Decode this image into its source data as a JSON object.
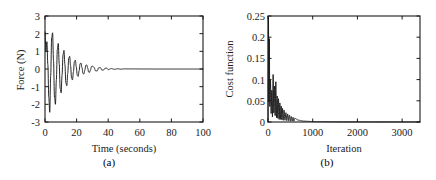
{
  "figure": {
    "background": "#ffffff",
    "line_color": "#1a1a1a",
    "panels": [
      {
        "id": "a",
        "caption": "(a)",
        "xlabel": "Time (seconds)",
        "ylabel": "Force (N)"
      },
      {
        "id": "b",
        "caption": "(b)",
        "xlabel": "Iteration",
        "ylabel": "Cost function"
      }
    ]
  },
  "chart_data": [
    {
      "type": "line",
      "panel": "a",
      "title": "",
      "xlabel": "Time (seconds)",
      "ylabel": "Force (N)",
      "xlim": [
        0,
        100
      ],
      "ylim": [
        -3,
        3
      ],
      "xticks": [
        0,
        20,
        40,
        60,
        80,
        100
      ],
      "xtick_labels": [
        "0",
        "20",
        "40",
        "60",
        "80",
        "100"
      ],
      "yticks": [
        -3,
        -2,
        -1,
        0,
        1,
        2,
        3
      ],
      "ytick_labels": [
        "-3",
        "-2",
        "-1",
        "0",
        "1",
        "2",
        "3"
      ],
      "grid": false,
      "legend": null,
      "description": "Damped oscillatory force response decaying to zero by about t = 55 s",
      "series": [
        {
          "name": "Force",
          "x": [
            0,
            0.6,
            1.2,
            1.8,
            2.4,
            3.0,
            3.6,
            4.2,
            4.8,
            5.4,
            6.0,
            6.6,
            7.2,
            7.8,
            8.4,
            9.0,
            9.6,
            10.2,
            10.8,
            11.4,
            12.0,
            12.6,
            13.2,
            13.8,
            14.4,
            15.0,
            15.6,
            16.2,
            16.8,
            17.4,
            18.0,
            18.6,
            19.2,
            19.8,
            20.4,
            21.0,
            21.6,
            22.2,
            22.8,
            23.4,
            24.0,
            24.6,
            25.2,
            25.8,
            26.4,
            27.0,
            27.6,
            28.2,
            28.8,
            29.4,
            30.0,
            31.0,
            32.0,
            33.0,
            34.0,
            35.0,
            36.0,
            37.0,
            38.0,
            39.0,
            40.0,
            42.0,
            44.0,
            46.0,
            48.0,
            50.0,
            55.0,
            60.0,
            70.0,
            80.0,
            90.0,
            100.0
          ],
          "y": [
            2.1,
            1.0,
            1.55,
            0.25,
            -1.6,
            -2.45,
            -0.4,
            1.75,
            2.05,
            0.45,
            -1.6,
            -2.0,
            -0.6,
            1.1,
            1.45,
            0.3,
            -1.1,
            -1.35,
            -0.35,
            0.8,
            1.05,
            0.25,
            -0.78,
            -0.95,
            -0.25,
            0.6,
            0.72,
            0.18,
            -0.52,
            -0.62,
            -0.16,
            0.42,
            0.5,
            0.13,
            -0.36,
            -0.42,
            -0.1,
            0.3,
            0.34,
            0.08,
            -0.25,
            -0.28,
            -0.07,
            0.2,
            0.23,
            0.06,
            -0.17,
            -0.19,
            -0.05,
            0.14,
            0.16,
            0.1,
            -0.1,
            -0.11,
            0.07,
            0.08,
            -0.06,
            -0.06,
            0.04,
            0.05,
            -0.035,
            0.025,
            -0.02,
            0.015,
            -0.012,
            0.008,
            0.004,
            0.002,
            0.0,
            0.0,
            0.0,
            0.0
          ]
        }
      ]
    },
    {
      "type": "line",
      "panel": "b",
      "title": "",
      "xlabel": "Iteration",
      "ylabel": "Cost function",
      "xlim": [
        0,
        3400
      ],
      "ylim": [
        0,
        0.25
      ],
      "xticks": [
        0,
        1000,
        2000,
        3000
      ],
      "xtick_labels": [
        "0",
        "1000",
        "2000",
        "3000"
      ],
      "yticks": [
        0,
        0.05,
        0.1,
        0.15,
        0.2,
        0.25
      ],
      "ytick_labels": [
        "0",
        "0.05",
        "0.1",
        "0.15",
        "0.2",
        "0.25"
      ],
      "grid": false,
      "legend": null,
      "description": "Cost function starts near 0.25, oscillates with decaying spikes and converges to ~0 after about 800 iterations",
      "series": [
        {
          "name": "Cost function",
          "x": [
            0,
            10,
            20,
            30,
            40,
            55,
            70,
            85,
            100,
            115,
            130,
            145,
            160,
            175,
            190,
            205,
            220,
            235,
            250,
            265,
            280,
            295,
            310,
            325,
            340,
            360,
            380,
            400,
            420,
            440,
            460,
            480,
            500,
            520,
            540,
            560,
            580,
            600,
            630,
            660,
            700,
            750,
            800,
            900,
            1000,
            1200,
            1500,
            1800,
            2100,
            2400,
            2700,
            3000,
            3400
          ],
          "y": [
            0.0,
            0.25,
            0.045,
            0.2,
            0.035,
            0.1,
            0.02,
            0.075,
            0.012,
            0.113,
            0.02,
            0.085,
            0.015,
            0.095,
            0.01,
            0.062,
            0.008,
            0.055,
            0.006,
            0.045,
            0.006,
            0.038,
            0.005,
            0.032,
            0.004,
            0.028,
            0.004,
            0.022,
            0.003,
            0.019,
            0.003,
            0.016,
            0.002,
            0.013,
            0.002,
            0.011,
            0.002,
            0.009,
            0.007,
            0.005,
            0.004,
            0.003,
            0.002,
            0.0015,
            0.001,
            0.0008,
            0.0005,
            0.0004,
            0.0003,
            0.0002,
            0.0002,
            0.0001,
            0.0001
          ]
        }
      ]
    }
  ]
}
